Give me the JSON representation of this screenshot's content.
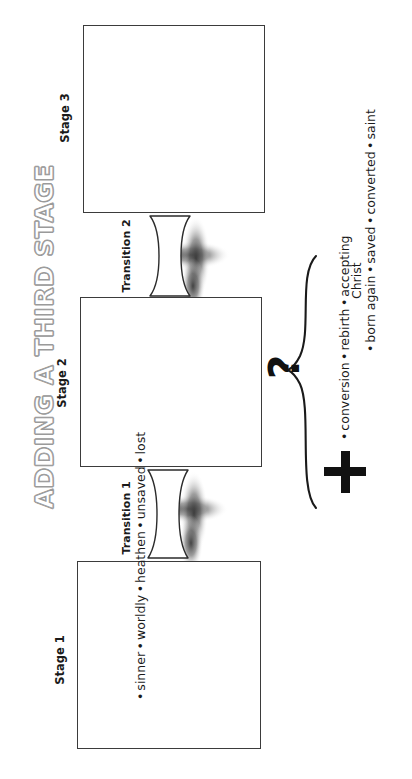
{
  "title": "ADDING A THIRD STAGE",
  "stages": [
    {
      "id": "stage3",
      "label": "Stage 3",
      "items": []
    },
    {
      "id": "stage2",
      "label": "Stage 2",
      "items": []
    },
    {
      "id": "stage1",
      "label": "Stage 1",
      "items": [
        "sinner",
        "worldly",
        "heathen",
        "unsaved",
        "lost"
      ]
    }
  ],
  "transitions": [
    {
      "id": "transition2",
      "label": "Transition 2"
    },
    {
      "id": "transition1",
      "label": "Transition 1"
    }
  ],
  "annotation": {
    "question_mark": "?",
    "plus_sign": "+",
    "brace_lists": [
      {
        "id": "left-list",
        "items": [
          "conversion",
          "rebirth",
          "accepting",
          "Christ"
        ],
        "bullets": [
          true,
          true,
          true,
          false
        ]
      },
      {
        "id": "right-list",
        "items": [
          "born again",
          "saved",
          "converted",
          "saint"
        ],
        "bullets": [
          true,
          true,
          true,
          true
        ]
      }
    ]
  },
  "bullet_char": "•",
  "colors": {
    "stroke": "#3b3b3b",
    "text": "#1a1a1a",
    "title_outline": "#9a9a9a",
    "background": "#ffffff",
    "shadow": "#555555"
  }
}
